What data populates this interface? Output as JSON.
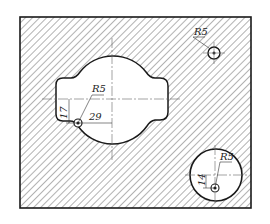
{
  "drawing": {
    "type": "mechanical-section-drawing",
    "colors": {
      "line": "#1a1a1a",
      "hatch": "#555555",
      "center_line": "#666666",
      "background": "#ffffff"
    },
    "outer_plate": {
      "x": 20,
      "y": 17,
      "width": 231,
      "height": 191,
      "hatched": true
    },
    "main_cutout": {
      "center_x": 112,
      "center_y": 98
    },
    "dimensions": {
      "left_hole_radius": "R5",
      "left_vertical": "17",
      "left_horizontal": "29",
      "top_right_hole_radius": "R5",
      "bottom_circle_hole_radius": "R5",
      "bottom_vertical": "14"
    },
    "holes": [
      {
        "name": "left-small-hole",
        "cx": 78,
        "cy": 123,
        "r": 5
      },
      {
        "name": "top-right-small-hole",
        "cx": 214,
        "cy": 53,
        "r": 6
      },
      {
        "name": "bottom-circle-small-hole",
        "cx": 215,
        "cy": 188,
        "r": 5
      }
    ],
    "bottom_circle": {
      "cx": 216,
      "cy": 175,
      "r": 26
    }
  }
}
